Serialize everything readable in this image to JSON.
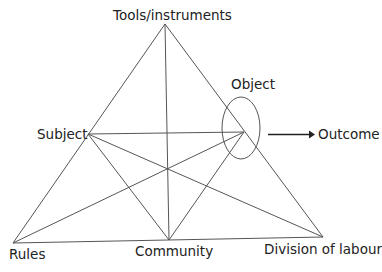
{
  "diagram": {
    "colors": {
      "background": "#ffffff",
      "lines": "#555555",
      "text": "#222222"
    },
    "nodes": {
      "tools": {
        "label": "Tools/instruments",
        "x": 165,
        "y": 24
      },
      "subject": {
        "label": "Subject",
        "x": 88,
        "y": 134
      },
      "object": {
        "label": "Object",
        "x": 244,
        "y": 132
      },
      "rules": {
        "label": "Rules",
        "x": 13,
        "y": 243
      },
      "community": {
        "label": "Community",
        "x": 169,
        "y": 240
      },
      "division": {
        "label": "Division of labour",
        "x": 323,
        "y": 237
      }
    },
    "outcome": {
      "label": "Outcome"
    },
    "edges": [
      [
        "tools",
        "rules"
      ],
      [
        "tools",
        "division"
      ],
      [
        "rules",
        "division"
      ],
      [
        "tools",
        "community"
      ],
      [
        "subject",
        "object"
      ],
      [
        "subject",
        "community"
      ],
      [
        "subject",
        "division"
      ],
      [
        "rules",
        "object"
      ],
      [
        "community",
        "object"
      ]
    ]
  }
}
